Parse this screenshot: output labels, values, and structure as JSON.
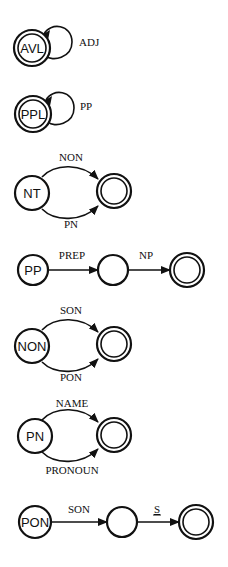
{
  "diagram": {
    "type": "finite-state transition networks",
    "networks": [
      {
        "name": "AVL",
        "start_state_label": "AVL",
        "start_is_final": true,
        "transitions": [
          {
            "from": "AVL",
            "to": "AVL",
            "label": "ADJ",
            "kind": "self-loop"
          }
        ]
      },
      {
        "name": "PPL",
        "start_state_label": "PPL",
        "start_is_final": true,
        "transitions": [
          {
            "from": "PPL",
            "to": "PPL",
            "label": "PP",
            "kind": "self-loop"
          }
        ]
      },
      {
        "name": "NT",
        "start_state_label": "NT",
        "transitions": [
          {
            "from": "NT",
            "to": "final",
            "label": "NON"
          },
          {
            "from": "NT",
            "to": "final",
            "label": "PN"
          }
        ]
      },
      {
        "name": "PP",
        "start_state_label": "PP",
        "transitions": [
          {
            "from": "PP",
            "to": "q1",
            "label": "PREP"
          },
          {
            "from": "q1",
            "to": "final",
            "label": "NP"
          }
        ]
      },
      {
        "name": "NON",
        "start_state_label": "NON",
        "transitions": [
          {
            "from": "NON",
            "to": "final",
            "label": "SON"
          },
          {
            "from": "NON",
            "to": "final",
            "label": "PON"
          }
        ]
      },
      {
        "name": "PN",
        "start_state_label": "PN",
        "transitions": [
          {
            "from": "PN",
            "to": "final",
            "label": "NAME"
          },
          {
            "from": "PN",
            "to": "final",
            "label": "PRONOUN"
          }
        ]
      },
      {
        "name": "PON",
        "start_state_label": "PON",
        "transitions": [
          {
            "from": "PON",
            "to": "q1",
            "label": "SON"
          },
          {
            "from": "q1",
            "to": "final",
            "label": "S",
            "underlined": true
          }
        ]
      }
    ]
  },
  "labels": {
    "avl": {
      "state": "AVL",
      "loop": "ADJ"
    },
    "ppl": {
      "state": "PPL",
      "loop": "PP"
    },
    "nt": {
      "state": "NT",
      "top": "NON",
      "bottom": "PN"
    },
    "pp": {
      "state": "PP",
      "first": "PREP",
      "second": "NP"
    },
    "non": {
      "state": "NON",
      "top": "SON",
      "bottom": "PON"
    },
    "pn": {
      "state": "PN",
      "top": "NAME",
      "bottom": "PRONOUN"
    },
    "pon": {
      "state": "PON",
      "first": "SON",
      "second": "S"
    }
  },
  "colors": {
    "stroke": "#111111",
    "background": "#ffffff"
  }
}
